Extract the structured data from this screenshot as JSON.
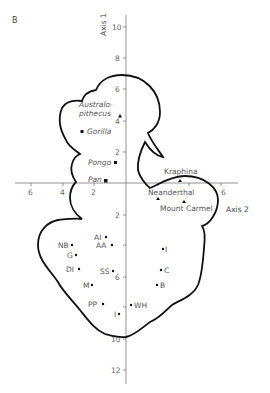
{
  "panel_label": "B",
  "axes": {
    "vertical": {
      "name": "Axis 1",
      "ticks_up": [
        "10",
        "8",
        "6",
        "4",
        "2"
      ],
      "ticks_down": [
        "2",
        "4",
        "6",
        "8",
        "10",
        "12"
      ]
    },
    "horizontal": {
      "name": "Axis 2",
      "ticks_left": [
        "6",
        "4",
        "2"
      ],
      "ticks_right": [
        "6"
      ]
    }
  },
  "points": {
    "australopithecus": {
      "label_line1": "Australo-",
      "label_line2": "pithecus",
      "marker": "triangle"
    },
    "gorilla": {
      "label": "Gorilla",
      "marker": "square"
    },
    "pongo": {
      "label": "Pongo",
      "marker": "square"
    },
    "pan": {
      "label": "Pan",
      "marker": "square"
    },
    "kraphina": {
      "label": "Kraphina",
      "marker": "triangle"
    },
    "neanderthal": {
      "label": "Neanderthal",
      "marker": "triangle"
    },
    "mount_carmel": {
      "label": "Mount Carmel",
      "marker": "triangle"
    },
    "ai": {
      "label": "AI",
      "marker": "dot"
    },
    "aa": {
      "label": "AA",
      "marker": "dot"
    },
    "nb": {
      "label": "NB",
      "marker": "dot"
    },
    "g": {
      "label": "G",
      "marker": "dot"
    },
    "di": {
      "label": "DI",
      "marker": "dot"
    },
    "ss": {
      "label": "SS",
      "marker": "dot"
    },
    "m": {
      "label": "M",
      "marker": "dot"
    },
    "pp": {
      "label": "PP",
      "marker": "dot"
    },
    "i_left": {
      "label": "I",
      "marker": "dot"
    },
    "wh": {
      "label": "WH",
      "marker": "dot"
    },
    "i_right": {
      "label": "I",
      "marker": "dot"
    },
    "c": {
      "label": "C",
      "marker": "dot"
    },
    "b": {
      "label": "B",
      "marker": "dot"
    }
  },
  "colors": {
    "line": "#111111",
    "axis": "#666666",
    "text": "#555555"
  }
}
